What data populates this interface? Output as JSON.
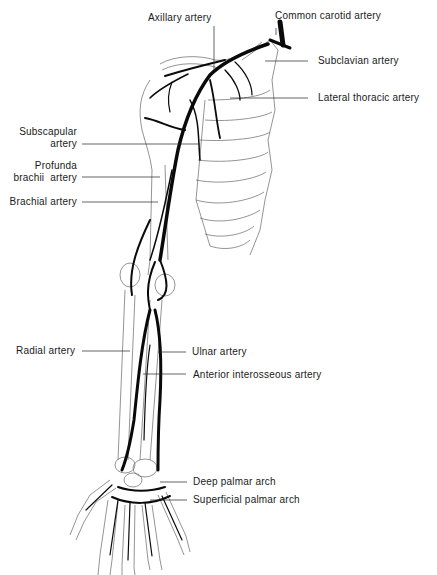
{
  "diagram": {
    "labels": {
      "axillary": "Axillary artery",
      "common_carotid": "Common carotid artery",
      "subclavian": "Subclavian artery",
      "lateral_thoracic": "Lateral thoracic artery",
      "subscapular_1": "Subscapular",
      "subscapular_2": "artery",
      "profunda_1": "Profunda",
      "profunda_2": "brachii  artery",
      "brachial": "Brachial artery",
      "radial": "Radial artery",
      "ulnar": "Ulnar artery",
      "anterior_interosseous": "Anterior interosseous artery",
      "deep_palmar": "Deep palmar arch",
      "superficial_palmar": "Superficial palmar arch"
    },
    "colors": {
      "artery": "#0a0a0a",
      "bone_outline": "#555555",
      "background": "#ffffff",
      "text": "#1a1a1a"
    }
  }
}
